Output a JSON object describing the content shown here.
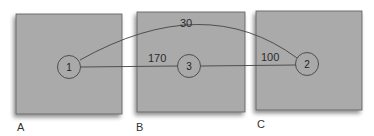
{
  "diagram": {
    "colors": {
      "box_fill": "#aaaaaa",
      "box_stroke": "#555555",
      "edge": "#444444",
      "node_fill": "#a9a9a9"
    },
    "regions": [
      {
        "id": "A",
        "label": "A"
      },
      {
        "id": "B",
        "label": "B"
      },
      {
        "id": "C",
        "label": "C"
      }
    ],
    "nodes": [
      {
        "id": "1",
        "label": "1",
        "region": "A"
      },
      {
        "id": "3",
        "label": "3",
        "region": "B"
      },
      {
        "id": "2",
        "label": "2",
        "region": "C"
      }
    ],
    "edges": [
      {
        "from": "1",
        "to": "2",
        "weight": "30",
        "shape": "curved"
      },
      {
        "from": "1",
        "to": "3",
        "weight": "170",
        "shape": "straight"
      },
      {
        "from": "3",
        "to": "2",
        "weight": "100",
        "shape": "straight"
      }
    ]
  }
}
